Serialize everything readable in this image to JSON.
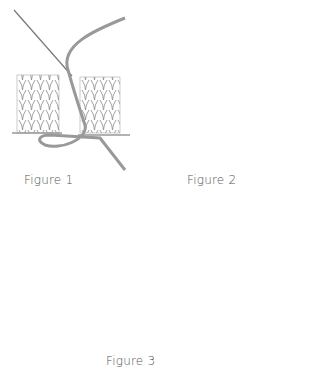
{
  "figures": [
    {
      "label": "Figure 1",
      "description": "Needle threaded through stitches, yarn looping from right piece to left piece"
    },
    {
      "label": "Figure 2",
      "description": "Needle picks up bar between stitches, yarn crossing both pieces"
    },
    {
      "label": "Figure 3",
      "description": "Multiple horizontal yarn passes joining two knitted pieces"
    }
  ],
  "colors": {
    "ink": "#7a7a7a",
    "yarn": "#9a9a9a",
    "background": "#ffffff"
  }
}
